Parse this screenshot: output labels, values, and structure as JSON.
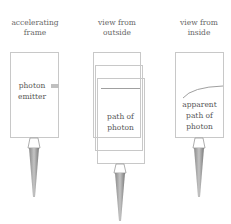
{
  "panels": [
    {
      "id": "accelerating-frame",
      "caption_line1": "accelerating",
      "caption_line2": "frame",
      "label_line1": "photon",
      "label_line2": "emitter"
    },
    {
      "id": "view-from-outside",
      "caption_line1": "view from",
      "caption_line2": "outside",
      "label_line1": "path of",
      "label_line2": "photon"
    },
    {
      "id": "view-from-inside",
      "caption_line1": "view from",
      "caption_line2": "inside",
      "label_line1": "apparent",
      "label_line2": "path of",
      "label_line3": "photon"
    }
  ],
  "colors": {
    "box_stroke": "#c8c8c8",
    "path_stroke": "#a0a0a0",
    "emitter_fill": "#c0c0c0",
    "flame_dark": "#777777",
    "flame_light": "#bbbbbb"
  }
}
